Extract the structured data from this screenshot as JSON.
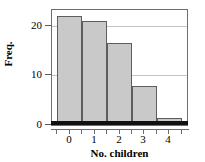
{
  "chart_data": {
    "type": "bar",
    "title": "",
    "subtitle": "",
    "xlabel": "No. children",
    "ylabel": "Freq.",
    "categories": [
      "0",
      "1",
      "2",
      "3",
      "4"
    ],
    "values": [
      22,
      21,
      16.5,
      7.8,
      1.5
    ],
    "series": [
      {
        "name": "Frequency",
        "values": [
          22,
          21,
          16.5,
          7.8,
          1.5
        ]
      }
    ],
    "xlim": [
      -0.72,
      4.72
    ],
    "ylim": [
      0,
      23.2
    ],
    "ytick_labels": [
      "0",
      "10",
      "20"
    ],
    "ytick_values": [
      0,
      10,
      20
    ],
    "xtick_labels": [
      "0",
      "1",
      "2",
      "3",
      "4"
    ],
    "xtick_values": [
      0,
      1,
      2,
      3,
      4
    ],
    "grid": "horizontal",
    "legend": "none",
    "legend_position": "none",
    "bar_fill_color": "#c9c9c9",
    "bar_edge_color": "#5d5d5d",
    "gridline_color": "#c4c4c4",
    "frame_color": "#6e6e6e",
    "baseline_color": "#111111",
    "text_color": "#000000",
    "background_color": "#ffffff"
  }
}
